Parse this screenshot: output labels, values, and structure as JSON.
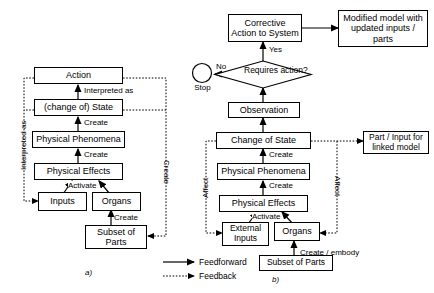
{
  "figure": {
    "panels": [
      {
        "id": "a",
        "caption": "a)",
        "nodes": [
          {
            "name": "action",
            "label": "Action"
          },
          {
            "name": "change-of-state",
            "label": "(change of) State"
          },
          {
            "name": "physical-phenomena",
            "label": "Physical Phenomena"
          },
          {
            "name": "physical-effects",
            "label": "Physical Effects"
          },
          {
            "name": "inputs",
            "label": "Inputs"
          },
          {
            "name": "organs",
            "label": "Organs"
          },
          {
            "name": "subset-of-parts",
            "label": "Subset of Parts"
          }
        ],
        "edge_labels": [
          {
            "name": "interpreted-as-vertical",
            "label": "Interpreted as"
          },
          {
            "name": "interpreted-as-inline",
            "label": "Interpreted as"
          },
          {
            "name": "create-state",
            "label": "Create"
          },
          {
            "name": "create-phenomena",
            "label": "Create"
          },
          {
            "name": "activate",
            "label": "Activate"
          },
          {
            "name": "create-organs",
            "label": "Create"
          },
          {
            "name": "create-vertical",
            "label": "Create"
          }
        ]
      },
      {
        "id": "b",
        "caption": "b)",
        "nodes": [
          {
            "name": "corrective-action",
            "label": "Corrective Action to System"
          },
          {
            "name": "modified-model",
            "label": "Modified model with updated inputs / parts"
          },
          {
            "name": "requires-action",
            "label": "Requires action?"
          },
          {
            "name": "stop",
            "label": "Stop"
          },
          {
            "name": "observation",
            "label": "Observation"
          },
          {
            "name": "change-of-state",
            "label": "Change of State"
          },
          {
            "name": "part-input-linked-model",
            "label": "Part / Input for linked model"
          },
          {
            "name": "physical-phenomena",
            "label": "Physical Phenomena"
          },
          {
            "name": "physical-effects",
            "label": "Physical Effects"
          },
          {
            "name": "external-inputs",
            "label": "External Inputs"
          },
          {
            "name": "organs",
            "label": "Organs"
          },
          {
            "name": "subset-of-parts",
            "label": "Subset of Parts"
          }
        ],
        "edge_labels": [
          {
            "name": "yes",
            "label": "Yes"
          },
          {
            "name": "no",
            "label": "No"
          },
          {
            "name": "create-state",
            "label": "Create"
          },
          {
            "name": "create-phenomena",
            "label": "Create"
          },
          {
            "name": "activate",
            "label": "Activate"
          },
          {
            "name": "create-embody",
            "label": "Create / embody"
          },
          {
            "name": "affect-left",
            "label": "Affect"
          },
          {
            "name": "affect-right",
            "label": "Affect"
          }
        ]
      }
    ],
    "legend": {
      "items": [
        {
          "name": "legend-feedforward",
          "label": "Feedforward",
          "style": "solid"
        },
        {
          "name": "legend-feedback",
          "label": "Feedback",
          "style": "dotted"
        }
      ]
    },
    "colors": {
      "line": "#000000",
      "background": "#ffffff",
      "text": "#000000"
    }
  }
}
